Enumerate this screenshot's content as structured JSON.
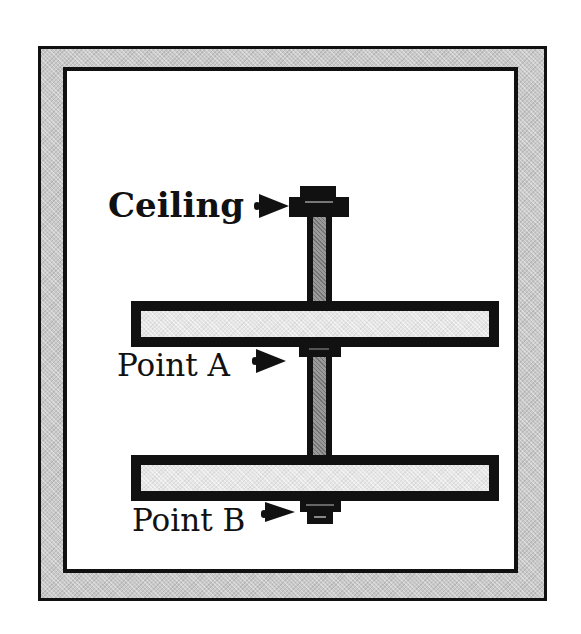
{
  "diagram": {
    "type": "bolt-and-planks-ceiling-mount",
    "labels": {
      "ceiling": "Ceiling",
      "point_a": "Point A",
      "point_b": "Point B"
    },
    "colors": {
      "outline": "#111111",
      "frame_fill": "#c9c9c9",
      "plank_fill": "#e6e6e6",
      "rod_fill": "#9a9a9a",
      "background": "#ffffff"
    },
    "components": [
      {
        "id": "ceiling-bolt-head",
        "label_ref": "ceiling"
      },
      {
        "id": "top-plank"
      },
      {
        "id": "point-a-nut",
        "label_ref": "point_a"
      },
      {
        "id": "bottom-plank"
      },
      {
        "id": "point-b-nut",
        "label_ref": "point_b"
      },
      {
        "id": "threaded-rod"
      }
    ]
  }
}
